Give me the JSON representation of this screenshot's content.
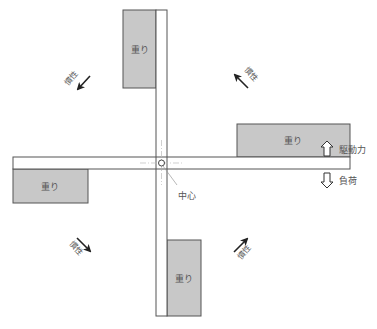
{
  "diagram": {
    "weights": [
      {
        "id": "top",
        "label": "重り"
      },
      {
        "id": "right",
        "label": "重り"
      },
      {
        "id": "left",
        "label": "重り"
      },
      {
        "id": "bottom",
        "label": "重り"
      }
    ],
    "inertia": [
      {
        "id": "upper-left",
        "label": "慣性"
      },
      {
        "id": "upper-right",
        "label": "慣性"
      },
      {
        "id": "lower-left",
        "label": "慣性"
      },
      {
        "id": "lower-right",
        "label": "慣性"
      }
    ],
    "center_label": "中心",
    "legend": {
      "drive_force": "駆動力",
      "load": "負荷"
    },
    "colors": {
      "weight_fill": "#c8c8c8",
      "outline": "#555555",
      "arrow": "#222222"
    }
  }
}
